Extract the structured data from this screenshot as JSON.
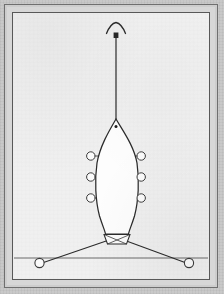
{
  "document": {
    "kind": "technical-line-drawing",
    "subject": "rowing shell plan view with towline and mooring lines",
    "orientation": "portrait",
    "width_px": 224,
    "height_px": 294
  },
  "palette": {
    "page_background": "#c6c6c6",
    "frame_mid": "#d7d7d7",
    "paper": "#efefef",
    "hull_fill": "#fdfdfd",
    "ink": "#2b2b2b",
    "ink_light": "#3a3a3a",
    "ring_fill": "#fbfbfb",
    "dot": "#1d1d1d"
  },
  "frame": {
    "outer_rule_color": "#6f6f6f",
    "inner_rule_color": "#585858",
    "has_double_border": "true",
    "band_texture": "scanned-noise"
  },
  "diagram": {
    "title": "",
    "hull": {
      "label": "boat-hull",
      "bow_point": {
        "x": 116,
        "y": 119
      },
      "stern_y": 232,
      "beam_left_x": 96,
      "beam_right_x": 136,
      "widest_y": 178,
      "fill": "#fdfdfd",
      "outline": "#2b2b2b"
    },
    "bow_dot": {
      "x": 116,
      "y": 126,
      "r": 1.4
    },
    "towline": {
      "label": "tow-line",
      "from": {
        "x": 116,
        "y": 119
      },
      "to": {
        "x": 116,
        "y": 33
      },
      "stroke_width": 1.1
    },
    "arrow_head": {
      "label": "direction-arrow",
      "apex": {
        "x": 116,
        "y": 24
      },
      "span_px": 19,
      "style": "open-chevron-curved"
    },
    "mast_block": {
      "x": 116,
      "y": 34,
      "w": 4,
      "h": 5
    },
    "oarlocks": {
      "count": 6,
      "radius": 4.2,
      "left_x": 91,
      "right_x": 141,
      "rows_y": [
        156,
        177,
        198
      ],
      "fill": "#fbfbfb",
      "stroke": "#3b3b3b"
    },
    "rigger_stubs": {
      "count": 6,
      "length_px": 6
    },
    "transom": {
      "label": "stern-transom",
      "top_left": {
        "x": 104,
        "y": 234
      },
      "top_right": {
        "x": 130,
        "y": 234
      },
      "bottom_left": {
        "x": 107,
        "y": 244
      },
      "bottom_right": {
        "x": 127,
        "y": 244
      }
    },
    "mooring_lines": [
      {
        "label": "mooring-line-left",
        "from": {
          "x": 112,
          "y": 238
        },
        "to": {
          "x": 43,
          "y": 263
        }
      },
      {
        "label": "mooring-line-right",
        "from": {
          "x": 122,
          "y": 238
        },
        "to": {
          "x": 186,
          "y": 263
        }
      }
    ],
    "buoys": [
      {
        "label": "buoy-left",
        "x": 39,
        "y": 263,
        "r": 4.6
      },
      {
        "label": "buoy-right",
        "x": 189,
        "y": 263,
        "r": 4.6
      }
    ],
    "waterline": {
      "label": "water-line",
      "y": 258,
      "x_start": 14,
      "x_end": 208,
      "stroke": "#6a6a6a"
    }
  }
}
